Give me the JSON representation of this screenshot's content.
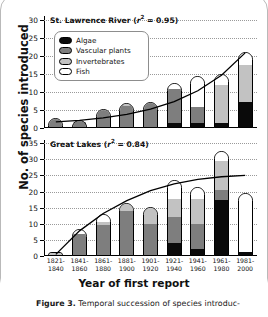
{
  "figure": {
    "ylabel": "No. of species introduced",
    "xlabel": "Year of first report",
    "caption_bold": "Figure 3.",
    "caption_rest": " Temporal succession of species introduc-"
  },
  "legend": {
    "items": [
      {
        "label": "Algae",
        "key": "algae",
        "color": "#0a0a0a"
      },
      {
        "label": "Vascular plants",
        "key": "vascular",
        "color": "#7e7e7e"
      },
      {
        "label": "Invertebrates",
        "key": "invert",
        "color": "#c2c2c2"
      },
      {
        "label": "Fish",
        "key": "fish",
        "color": "#ffffff"
      }
    ]
  },
  "panels": {
    "top": {
      "title_text": "St. Lawrence River (r",
      "title_sup": "2",
      "title_tail": " = 0.95)",
      "title_full": "St. Lawrence River (r2 = 0.95)",
      "yticks": [
        0,
        5,
        10,
        15,
        20,
        25,
        30
      ],
      "ymax": 31
    },
    "bottom": {
      "title_text": "Great Lakes (r",
      "title_sup": "2",
      "title_tail": " = 0.84)",
      "title_full": "Great Lakes (r2 = 0.84)",
      "yticks": [
        0,
        5,
        10,
        15,
        20,
        25,
        30,
        35
      ],
      "ymax": 36
    }
  },
  "chart_data": [
    {
      "type": "bar",
      "id": "st-lawrence-river",
      "title": "St. Lawrence River (r2 = 0.95)",
      "stacked": true,
      "xlabel": "Year of first report",
      "ylabel": "No. of species introduced",
      "ylim": [
        0,
        31
      ],
      "yticks": [
        0,
        5,
        10,
        15,
        20,
        25,
        30
      ],
      "grid": true,
      "legend_position": "inside-upper-left",
      "annotation": "r2 = 0.95",
      "categories": [
        "1821-1840",
        "1841-1860",
        "1861-1880",
        "1881-1900",
        "1901-1920",
        "1921-1940",
        "1941-1960",
        "1961-1980",
        "1981-2000"
      ],
      "series": [
        {
          "name": "Algae",
          "values": [
            0,
            0,
            0,
            0,
            0,
            1.0,
            1.0,
            1.0,
            6.8
          ]
        },
        {
          "name": "Vascular plants",
          "values": [
            2.7,
            2.2,
            4.8,
            5.8,
            7.2,
            9.5,
            4.5,
            0,
            0
          ]
        },
        {
          "name": "Invertebrates",
          "values": [
            0,
            0,
            0.6,
            0.7,
            0,
            0,
            0,
            10.5,
            10.4
          ]
        },
        {
          "name": "Fish",
          "values": [
            0,
            0,
            0,
            0.5,
            0,
            2.0,
            9.0,
            3.5,
            3.8
          ]
        }
      ],
      "totals": [
        2.7,
        2.2,
        5.4,
        7.0,
        7.2,
        12.5,
        14.5,
        15.0,
        21.0
      ],
      "fitted_curve": {
        "label": "exponential fit",
        "r_squared": 0.95,
        "x": [
          "1821-1840",
          "1841-1860",
          "1861-1880",
          "1881-1900",
          "1901-1920",
          "1921-1940",
          "1941-1960",
          "1961-1980",
          "1981-2000"
        ],
        "y": [
          1.7,
          2.1,
          2.8,
          3.8,
          5.2,
          7.3,
          10.3,
          14.6,
          20.8
        ]
      }
    },
    {
      "type": "bar",
      "id": "great-lakes",
      "title": "Great Lakes (r2 = 0.84)",
      "stacked": true,
      "xlabel": "Year of first report",
      "ylabel": "No. of species introduced",
      "ylim": [
        0,
        36
      ],
      "yticks": [
        0,
        5,
        10,
        15,
        20,
        25,
        30,
        35
      ],
      "grid": true,
      "annotation": "r2 = 0.84",
      "categories": [
        "1821-1840",
        "1841-1860",
        "1861-1880",
        "1881-1900",
        "1901-1920",
        "1921-1940",
        "1941-1960",
        "1961-1980",
        "1981-2000"
      ],
      "series": [
        {
          "name": "Algae",
          "values": [
            0,
            0,
            0,
            0,
            0,
            3.8,
            2.0,
            17.2,
            1.0
          ]
        },
        {
          "name": "Vascular plants",
          "values": [
            0,
            6.5,
            9.3,
            13.8,
            9.7,
            8.0,
            7.5,
            3.0,
            0
          ]
        },
        {
          "name": "Invertebrates",
          "values": [
            1.2,
            0,
            0.8,
            2.2,
            5.5,
            5.5,
            8.0,
            9.0,
            0
          ]
        },
        {
          "name": "Fish",
          "values": [
            0,
            2.0,
            3.0,
            0.5,
            0,
            6.2,
            4.0,
            3.3,
            18.5
          ]
        }
      ],
      "totals": [
        1.2,
        8.5,
        13.1,
        16.5,
        15.2,
        23.5,
        21.5,
        32.5,
        19.5
      ],
      "fitted_curve": {
        "label": "asymptotic fit",
        "r_squared": 0.84,
        "x": [
          "1821-1840",
          "1841-1860",
          "1861-1880",
          "1881-1900",
          "1901-1920",
          "1921-1940",
          "1941-1960",
          "1961-1980",
          "1981-2000"
        ],
        "y": [
          0.5,
          7.8,
          13.2,
          17.2,
          20.3,
          22.4,
          23.8,
          24.6,
          25.0
        ]
      }
    }
  ]
}
